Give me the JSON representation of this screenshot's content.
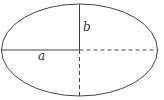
{
  "diagram": {
    "type": "ellipse",
    "labels": {
      "semi_major": "a",
      "semi_minor": "b"
    },
    "stroke_color": "#444444"
  }
}
